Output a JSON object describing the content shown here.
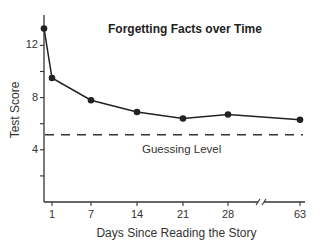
{
  "chart_data": {
    "type": "line",
    "title": "Forgetting Facts over Time",
    "xlabel": "Days Since Reading the Story",
    "ylabel": "Test Score",
    "x": [
      0,
      1,
      7,
      14,
      21,
      28,
      63
    ],
    "x_tick_labels": [
      "1",
      "7",
      "14",
      "21",
      "28",
      "63"
    ],
    "y_tick_labels": [
      "4",
      "8",
      "12"
    ],
    "ylim": [
      0,
      14
    ],
    "series": [
      {
        "name": "Test Score",
        "values": [
          13.3,
          9.5,
          7.8,
          6.9,
          6.4,
          6.7,
          6.3
        ],
        "marker": "circle",
        "color": "#222222"
      }
    ],
    "reference_lines": [
      {
        "name": "Guessing Level",
        "y": 5,
        "style": "dashed"
      }
    ],
    "annotations": [
      "Guessing Level"
    ],
    "axis_break": "between 28 and 63 on x-axis",
    "grid": false,
    "legend": "none"
  },
  "labels": {
    "title": "Forgetting Facts over Time",
    "xlabel": "Days Since Reading the Story",
    "ylabel": "Test Score",
    "guess": "Guessing Level"
  }
}
